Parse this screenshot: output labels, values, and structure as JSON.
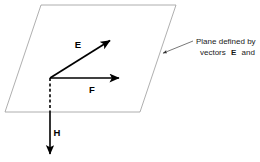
{
  "figure": {
    "background_color": "#ffffff",
    "plane": {
      "name": "plane-parallelogram",
      "stroke_color": "#9a9a9a",
      "stroke_width": 0.8,
      "fill": "none",
      "points": "41,5 176,5 140,112 5,112"
    },
    "vectors": [
      {
        "id": "E",
        "label": "E",
        "label_x": 78,
        "label_y": 48,
        "x1": 50,
        "y1": 78,
        "x2": 112,
        "y2": 39,
        "style": "solid",
        "color": "#000000",
        "width": 1.6
      },
      {
        "id": "F",
        "label": "F",
        "label_x": 92,
        "label_y": 93,
        "x1": 50,
        "y1": 78,
        "x2": 122,
        "y2": 78,
        "style": "solid",
        "color": "#000000",
        "width": 1.6
      },
      {
        "id": "H",
        "label": "H",
        "label_x": 52,
        "label_y": 136,
        "x1": 50,
        "y1": 78,
        "x2": 50,
        "y2": 157,
        "style": "dashed-then-solid",
        "dash_end_y": 112,
        "color": "#000000",
        "width": 1.6
      }
    ],
    "annotation": {
      "name": "plane-annotation",
      "line_1": "Plane defined by",
      "line_2_prefix": "vectors",
      "line_2_vector_a": "E",
      "line_2_conjunction": "and",
      "line_2_vector_b": "F",
      "text_x": 196,
      "line_1_y": 44,
      "line_2_y": 55,
      "leader": {
        "x1": 193,
        "y1": 41,
        "x2": 161,
        "y2": 54,
        "color": "#4a4a4a",
        "width": 0.7
      }
    }
  }
}
